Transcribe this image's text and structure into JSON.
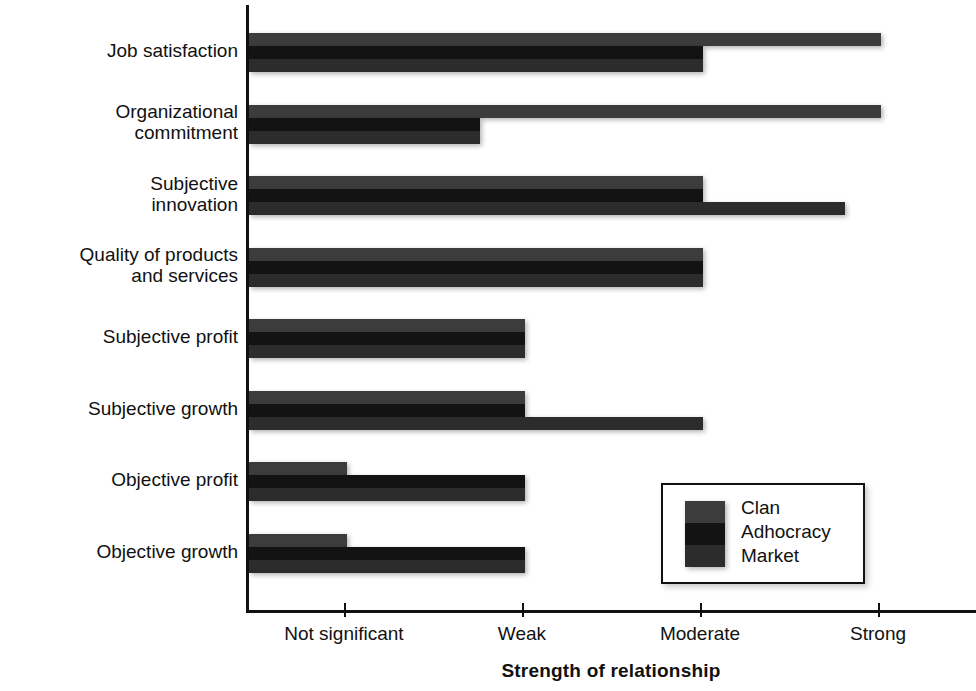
{
  "chart_data": {
    "type": "bar",
    "orientation": "horizontal",
    "title": "",
    "xlabel": "Strength of relationship",
    "ylabel": "Variables",
    "grid": false,
    "legend_position": "inside-bottom-right",
    "x_tick_labels": [
      "Not significant",
      "Weak",
      "Moderate",
      "Strong"
    ],
    "x_tick_values": [
      1,
      2,
      3,
      4
    ],
    "xlim": [
      0.45,
      4.55
    ],
    "categories": [
      "Job satisfaction",
      "Organizational commitment",
      "Subjective innovation",
      "Quality of products and services",
      "Subjective profit",
      "Subjective growth",
      "Objective profit",
      "Objective growth"
    ],
    "series": [
      {
        "name": "Clan",
        "color": "#3c3c3c",
        "values": [
          4,
          4,
          3,
          3,
          2,
          2,
          1,
          1
        ],
        "value_labels": [
          "Strong",
          "Strong",
          "Moderate",
          "Moderate",
          "Weak",
          "Weak",
          "Not significant",
          "Not significant"
        ]
      },
      {
        "name": "Adhocracy",
        "color": "#131313",
        "values": [
          3,
          1.75,
          3,
          3,
          2,
          2,
          2,
          2
        ],
        "value_labels": [
          "Moderate",
          "Between not significant and weak",
          "Moderate",
          "Moderate",
          "Weak",
          "Weak",
          "Weak",
          "Weak"
        ]
      },
      {
        "name": "Market",
        "color": "#2c2c2c",
        "values": [
          3,
          1.75,
          3.8,
          3,
          2,
          3,
          2,
          2
        ],
        "value_labels": [
          "Moderate",
          "Between not significant and weak",
          "Strong",
          "Moderate",
          "Weak",
          "Moderate",
          "Weak",
          "Weak"
        ]
      }
    ]
  },
  "axes": {
    "x_title": "Strength of relationship",
    "y_title": "Variables"
  },
  "legend": {
    "entries": [
      {
        "label": "Clan",
        "color": "#3c3c3c"
      },
      {
        "label": "Adhocracy",
        "color": "#131313"
      },
      {
        "label": "Market",
        "color": "#2c2c2c"
      }
    ]
  },
  "categories_display": [
    {
      "lines": [
        "Job satisfaction"
      ]
    },
    {
      "lines": [
        "Organizational",
        "commitment"
      ]
    },
    {
      "lines": [
        "Subjective",
        "innovation"
      ]
    },
    {
      "lines": [
        "Quality of products",
        "and services"
      ]
    },
    {
      "lines": [
        "Subjective profit"
      ]
    },
    {
      "lines": [
        "Subjective growth"
      ]
    },
    {
      "lines": [
        "Objective profit"
      ]
    },
    {
      "lines": [
        "Objective growth"
      ]
    }
  ],
  "ticks": [
    {
      "label": "Not significant",
      "value": 1
    },
    {
      "label": "Weak",
      "value": 2
    },
    {
      "label": "Moderate",
      "value": 3
    },
    {
      "label": "Strong",
      "value": 4
    }
  ]
}
